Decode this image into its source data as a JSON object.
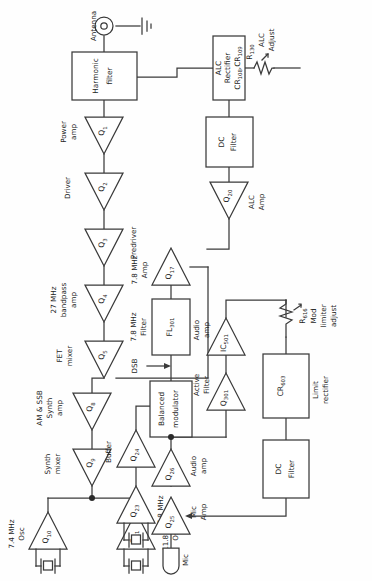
{
  "diagram": {
    "orientation": "rotated-90-ccw",
    "colors": {
      "line": "#3a3a3a",
      "text": "#1d1d1d",
      "background": "#fefefe"
    },
    "nodes": {
      "antenna": {
        "label": "Antenna",
        "icon": "antenna-connector-icon"
      },
      "ground": {
        "label": "",
        "icon": "ground-icon"
      },
      "harmonic_filter": {
        "line1": "Harmonic",
        "line2": "filter"
      },
      "q1": {
        "ref": "Q",
        "sub": "1",
        "caption1": "Power",
        "caption2": "amp"
      },
      "q2": {
        "ref": "Q",
        "sub": "2",
        "caption1": "Driver",
        "caption2": ""
      },
      "q3": {
        "ref": "Q",
        "sub": "3",
        "caption1": "Predriver",
        "caption2": ""
      },
      "q4": {
        "ref": "Q",
        "sub": "4",
        "caption1": "27 MHz",
        "caption2": "bandpass",
        "caption3": "amp"
      },
      "q5": {
        "ref": "Q",
        "sub": "5",
        "caption1": "FET",
        "caption2": "mixer"
      },
      "q8": {
        "ref": "Q",
        "sub": "8",
        "caption1": "AM & SSB",
        "caption2": "Synth",
        "caption3": "amp"
      },
      "q9": {
        "ref": "Q",
        "sub": "9",
        "caption1": "Synth",
        "caption2": "mixer"
      },
      "q10": {
        "ref": "Q",
        "sub": "10",
        "caption1": "7.4 MHz",
        "caption2": "Osc",
        "icon": "crystal-icon"
      },
      "q11": {
        "ref": "Q",
        "sub": "11",
        "caption1": "11.8 MHz",
        "caption2": "Osc",
        "icon": "crystal-icon"
      },
      "q17": {
        "ref": "Q",
        "sub": "17",
        "caption1": "7.8 MHz",
        "caption2": "Amp"
      },
      "q20": {
        "ref": "Q",
        "sub": "20",
        "caption1": "ALC",
        "caption2": "Amp"
      },
      "alc_rectifier": {
        "line1": "ALC",
        "line2": "Rectifier",
        "line3": "CR",
        "sub3a": "108",
        "line3b": ",CR",
        "sub3b": "109"
      },
      "r130": {
        "ref": "R",
        "sub": "130",
        "caption1": "ALC",
        "caption2": "Adjust",
        "icon": "resistor-icon"
      },
      "dc_filter_alc": {
        "line1": "DC",
        "line2": "Filter"
      },
      "fl301": {
        "ref": "FL",
        "sub": "301",
        "caption1": "7.8 MHz",
        "caption2": "Filter"
      },
      "dsb": {
        "label": "DSB",
        "icon": "arrow-icon"
      },
      "balanced_modulator": {
        "line1": "Balanced",
        "line2": "modulator"
      },
      "ic501": {
        "ref": "IC",
        "sub": "501",
        "caption1": "Audio",
        "caption2": "amp"
      },
      "q301": {
        "ref": "Q",
        "sub": "301",
        "caption1": "Active",
        "caption2": "Filter"
      },
      "q23": {
        "ref": "Q",
        "sub": "23",
        "caption1": "7.8 MHz",
        "caption2": "Osc",
        "icon": "crystal-icon"
      },
      "q24": {
        "ref": "Q",
        "sub": "24",
        "caption1": "Buffer",
        "caption2": ""
      },
      "q25": {
        "ref": "Q",
        "sub": "25",
        "caption1": "Mic",
        "caption2": "Amp"
      },
      "q26": {
        "ref": "Q",
        "sub": "26",
        "caption1": "Audio",
        "caption2": "amp"
      },
      "mic": {
        "label": "Mic",
        "icon": "microphone-icon"
      },
      "cr603": {
        "ref": "CR",
        "sub": "603",
        "caption1": "Limit",
        "caption2": "rectifier"
      },
      "r616": {
        "ref": "R",
        "sub": "616",
        "caption1": "Mod",
        "caption2": "limiter",
        "caption3": "adjust",
        "icon": "resistor-icon"
      },
      "dc_filter_mod": {
        "line1": "DC",
        "line2": "Filter"
      }
    }
  }
}
